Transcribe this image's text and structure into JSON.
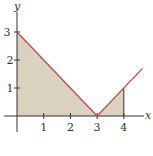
{
  "chart_data": {
    "type": "area",
    "title": "",
    "function": "y = |x - 3|",
    "xlabel": "x",
    "ylabel": "y",
    "xlim": [
      0,
      4.7
    ],
    "ylim": [
      0,
      3.3
    ],
    "x_ticks": [
      "1",
      "2",
      "3",
      "4"
    ],
    "y_ticks": [
      "1",
      "2",
      "3"
    ],
    "grid": false,
    "legend": null,
    "line": {
      "x": [
        0,
        3,
        4.7
      ],
      "y": [
        3,
        0,
        1.7
      ],
      "color": "#c8474a"
    },
    "shaded_region": {
      "x_from": 0,
      "x_to": 4,
      "points": [
        [
          0,
          0
        ],
        [
          0,
          3
        ],
        [
          3,
          0
        ],
        [
          4,
          1
        ],
        [
          4,
          0
        ]
      ],
      "color": "#d9d2bf"
    }
  },
  "colors": {
    "line": "#c8474a",
    "fill": "#d9d2bf",
    "axis": "#333333"
  }
}
